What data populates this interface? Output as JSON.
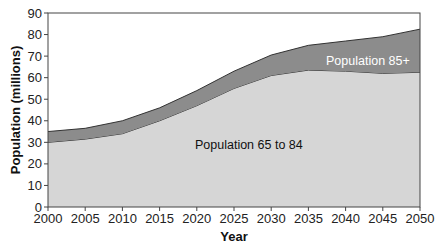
{
  "chart_data": {
    "type": "area",
    "stacked": true,
    "title": "",
    "xlabel": "Year",
    "ylabel": "Population (millions)",
    "x": [
      2000,
      2005,
      2010,
      2015,
      2020,
      2025,
      2030,
      2035,
      2040,
      2045,
      2050
    ],
    "xticks": [
      "2000",
      "2005",
      "2010",
      "2015",
      "2020",
      "2025",
      "2030",
      "2035",
      "2040",
      "2045",
      "2050"
    ],
    "yticks": [
      0,
      10,
      20,
      30,
      40,
      50,
      60,
      70,
      80,
      90
    ],
    "ylim": [
      0,
      90
    ],
    "xlim": [
      2000,
      2050
    ],
    "grid": false,
    "legend": "none (inline annotations)",
    "series": [
      {
        "name": "Population 65 to 84",
        "values": [
          30,
          31.5,
          34,
          40,
          47,
          55,
          61,
          63.5,
          63,
          62,
          62.5
        ],
        "color": "#d6d6d6"
      },
      {
        "name": "Population 85+",
        "values": [
          5,
          5,
          6,
          6,
          7,
          8,
          9.5,
          11.5,
          14,
          17,
          20
        ],
        "color": "#8c8c8c"
      }
    ],
    "totals": [
      35,
      36.5,
      40,
      46,
      54,
      63,
      70.5,
      75,
      77,
      79,
      82.5
    ],
    "annotations": [
      {
        "text": "Population 65 to 84",
        "x": 2027,
        "y": 27,
        "color": "#111111"
      },
      {
        "text": "Population 85+",
        "x": 2043,
        "y": 66,
        "color": "#ffffff"
      }
    ]
  }
}
